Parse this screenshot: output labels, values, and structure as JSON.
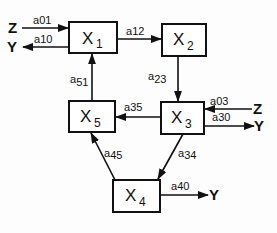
{
  "diagram": {
    "type": "compartmental-flow-diagram",
    "nodes": [
      {
        "id": "X1",
        "letter": "X",
        "sub": "1"
      },
      {
        "id": "X2",
        "letter": "X",
        "sub": "2"
      },
      {
        "id": "X3",
        "letter": "X",
        "sub": "3"
      },
      {
        "id": "X4",
        "letter": "X",
        "sub": "4"
      },
      {
        "id": "X5",
        "letter": "X",
        "sub": "5"
      }
    ],
    "edges": [
      {
        "from": "Z",
        "to": "X1",
        "label": "a01"
      },
      {
        "from": "X1",
        "to": "Y",
        "label": "a10"
      },
      {
        "from": "X1",
        "to": "X2",
        "label": "a12"
      },
      {
        "from": "X2",
        "to": "X3",
        "label": "a23"
      },
      {
        "from": "X3",
        "to": "X5",
        "label": "a35"
      },
      {
        "from": "Z",
        "to": "X3",
        "label": "a03"
      },
      {
        "from": "X3",
        "to": "Y",
        "label": "a30"
      },
      {
        "from": "X3",
        "to": "X4",
        "label": "a34"
      },
      {
        "from": "X4",
        "to": "X5",
        "label": "a45"
      },
      {
        "from": "X5",
        "to": "X1",
        "label": "a51"
      },
      {
        "from": "X4",
        "to": "Y",
        "label": "a40"
      }
    ],
    "coef_prefix": "a",
    "coef_subs": {
      "a01": "01",
      "a10": "10",
      "a12": "12",
      "a23": "23",
      "a35": "35",
      "a03": "03",
      "a30": "30",
      "a34": "34",
      "a45": "45",
      "a51": "51",
      "a40": "40"
    },
    "io": {
      "z_left": "Z",
      "y_left": "Y",
      "z_right": "Z",
      "y_right": "Y",
      "y_bottom": "Y"
    }
  }
}
